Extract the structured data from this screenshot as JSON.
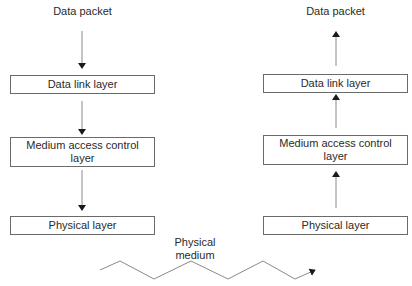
{
  "left_stack": {
    "top_label": "Data packet",
    "layers": [
      "Data link layer",
      "Medium access control layer",
      "Physical layer"
    ],
    "direction": "down"
  },
  "right_stack": {
    "top_label": "Data packet",
    "layers": [
      "Data link layer",
      "Medium access control layer",
      "Physical layer"
    ],
    "direction": "up"
  },
  "medium": {
    "label_line1": "Physical",
    "label_line2": "medium"
  },
  "colors": {
    "line": "#6a6a6a",
    "text": "#2a2a2a"
  }
}
